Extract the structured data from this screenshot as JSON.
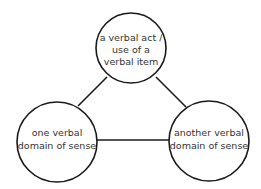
{
  "diagram": {
    "type": "triangle-relation",
    "colors": {
      "stroke": "#1a1a1a",
      "fill": "#ffffff",
      "text": "#333333"
    },
    "nodes": [
      {
        "id": "top",
        "lines": [
          "a verbal act /",
          "use of a",
          "verbal item"
        ]
      },
      {
        "id": "left",
        "lines": [
          "one verbal",
          "domain of sense"
        ]
      },
      {
        "id": "right",
        "lines": [
          "another verbal",
          "domain of sense"
        ]
      }
    ],
    "edges": [
      {
        "from": "top",
        "to": "left"
      },
      {
        "from": "top",
        "to": "right"
      },
      {
        "from": "left",
        "to": "right"
      }
    ]
  }
}
